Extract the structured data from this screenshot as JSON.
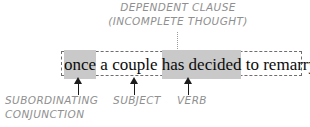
{
  "diagram": {
    "type": "grammar-clause-annotation",
    "top_annotation": {
      "line1": "DEPENDENT CLAUSE",
      "line2": "(INCOMPLETE THOUGHT)",
      "connector_icon": "dotted-vertical-line-icon"
    },
    "clause_box": {
      "border_style": "dashed",
      "segments": [
        {
          "text": "once",
          "highlighted": true
        },
        {
          "text": " a couple ",
          "highlighted": false
        },
        {
          "text": "has decided",
          "highlighted": true
        },
        {
          "text": " to remarry",
          "highlighted": false
        }
      ],
      "full_text": "once a couple has decided to remarry"
    },
    "callouts": [
      {
        "id": "subordinating-conjunction",
        "arrow_icon": "arrow-up-icon",
        "label_line1": "SUBORDINATING",
        "label_line2": "CONJUNCTION",
        "targets": "once"
      },
      {
        "id": "subject",
        "arrow_icon": "arrow-up-icon",
        "label_line1": "SUBJECT",
        "label_line2": "",
        "targets": "a couple"
      },
      {
        "id": "verb",
        "arrow_icon": "arrow-up-icon",
        "label_line1": "VERB",
        "label_line2": "",
        "targets": "has decided"
      }
    ]
  },
  "colors": {
    "background": "#ffffff",
    "annotation_text": "#8f8f8f",
    "clause_text": "#0b0b0b",
    "highlight": "#c9c9c9",
    "box_border": "#6e6e6e",
    "arrow": "#1c1c1c"
  }
}
